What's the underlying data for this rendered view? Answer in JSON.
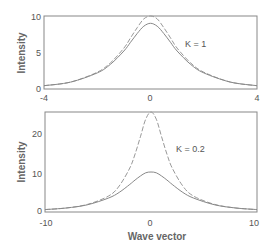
{
  "chart_data": [
    {
      "type": "line",
      "panel": "top",
      "title": "",
      "annotation": "K = 1",
      "xlabel": "",
      "ylabel": "Intensity",
      "xlim": [
        -4,
        4
      ],
      "ylim": [
        0,
        10
      ],
      "xticks": [
        "-4",
        "0",
        "4"
      ],
      "yticks": [
        "0",
        "5",
        "10"
      ],
      "grid": false,
      "x": [
        -4,
        -3,
        -2,
        -1.5,
        -1,
        -0.75,
        -0.5,
        -0.25,
        0,
        0.25,
        0.5,
        0.75,
        1,
        1.5,
        2,
        3,
        4
      ],
      "series": [
        {
          "name": "dashed",
          "style": "dashed",
          "values": [
            0.45,
            0.95,
            2.3,
            3.6,
            5.6,
            7.0,
            8.4,
            9.6,
            10.0,
            9.6,
            8.4,
            7.0,
            5.6,
            3.6,
            2.3,
            0.95,
            0.45
          ]
        },
        {
          "name": "solid",
          "style": "solid",
          "values": [
            0.45,
            0.95,
            2.2,
            3.4,
            5.2,
            6.4,
            7.6,
            8.6,
            9.0,
            8.6,
            7.6,
            6.4,
            5.2,
            3.4,
            2.2,
            0.95,
            0.45
          ]
        }
      ]
    },
    {
      "type": "line",
      "panel": "bottom",
      "title": "",
      "annotation": "K = 0.2",
      "xlabel": "Wave vector",
      "ylabel": "Intensity",
      "xlim": [
        -10,
        10
      ],
      "ylim": [
        0,
        25
      ],
      "xticks": [
        "-10",
        "0",
        "10"
      ],
      "yticks": [
        "0",
        "10",
        "20"
      ],
      "grid": false,
      "x": [
        -10,
        -8,
        -6,
        -4,
        -3,
        -2,
        -1.5,
        -1,
        -0.5,
        0,
        0.5,
        1,
        1.5,
        2,
        3,
        4,
        6,
        8,
        10
      ],
      "series": [
        {
          "name": "dashed",
          "style": "dashed",
          "values": [
            0.6,
            1.0,
            1.9,
            4.0,
            6.5,
            11.0,
            14.5,
            18.8,
            23.2,
            25.0,
            23.2,
            18.8,
            14.5,
            11.0,
            6.5,
            4.0,
            1.9,
            1.0,
            0.6
          ]
        },
        {
          "name": "solid",
          "style": "solid",
          "values": [
            0.6,
            1.0,
            1.8,
            3.5,
            4.9,
            6.9,
            8.0,
            9.0,
            9.8,
            10.0,
            9.8,
            9.0,
            8.0,
            6.9,
            4.9,
            3.5,
            1.8,
            1.0,
            0.6
          ]
        }
      ]
    }
  ]
}
